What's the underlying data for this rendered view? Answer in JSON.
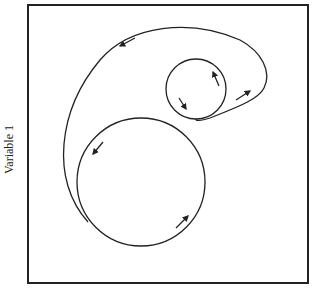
{
  "figure": {
    "ylabel": "Variable 1",
    "xlabel": "",
    "frame": {
      "x": 28,
      "y": 5,
      "w": 280,
      "h": 278
    },
    "stroke_color": "#222222",
    "curves": [
      {
        "name": "large-circle",
        "cx": 141,
        "cy": 182,
        "r": 64
      },
      {
        "name": "small-circle",
        "cx": 196,
        "cy": 89,
        "r": 30
      },
      {
        "name": "outer-loop",
        "d": "M 88 222 C 50 180, 58 110, 100 60 C 130 25, 190 18, 240 40 C 262 52, 272 72, 264 88 C 258 100, 235 108, 210 118 C 200 121, 195 121, 196 119"
      }
    ],
    "arrows": [
      {
        "name": "arrow-outer-top",
        "x1": 135,
        "y1": 38,
        "x2": 120,
        "y2": 46
      },
      {
        "name": "arrow-outer-right",
        "x1": 236,
        "y1": 100,
        "x2": 250,
        "y2": 91
      },
      {
        "name": "arrow-large-left",
        "x1": 103,
        "y1": 142,
        "x2": 93,
        "y2": 154
      },
      {
        "name": "arrow-large-bottom",
        "x1": 176,
        "y1": 228,
        "x2": 188,
        "y2": 216
      },
      {
        "name": "arrow-small-top",
        "x1": 219,
        "y1": 86,
        "x2": 213,
        "y2": 72
      },
      {
        "name": "arrow-small-left",
        "x1": 179,
        "y1": 98,
        "x2": 186,
        "y2": 109
      }
    ]
  }
}
